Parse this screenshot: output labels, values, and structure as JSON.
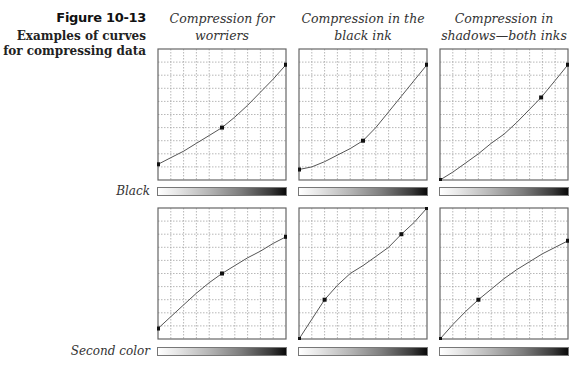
{
  "figure": {
    "number": "Figure 10-13",
    "caption": "Examples of curves for compressing data"
  },
  "columns": [
    {
      "title_line1": "Compression for",
      "title_line2": "worriers"
    },
    {
      "title_line1": "Compression in the",
      "title_line2": "black ink"
    },
    {
      "title_line1": "Compression in",
      "title_line2": "shadows—both inks"
    }
  ],
  "rows": [
    {
      "label": "Black"
    },
    {
      "label": "Second color"
    }
  ],
  "colors": {
    "grid_line": "#9a9a9a",
    "frame": "#666666",
    "curve": "#555555",
    "point": "#111111"
  },
  "chart_data": {
    "type": "line",
    "title": "Examples of curves for compressing data",
    "grid": {
      "divisions_x": 10,
      "divisions_y": 10,
      "dashed": true
    },
    "axis_range": {
      "x": [
        0,
        1
      ],
      "y": [
        0,
        1
      ]
    },
    "panels": [
      {
        "row": "Black",
        "column": "Compression for worriers",
        "points": [
          [
            0,
            0.12
          ],
          [
            0.5,
            0.4
          ],
          [
            1.0,
            0.88
          ]
        ],
        "curve": [
          [
            0,
            0.12
          ],
          [
            0.1,
            0.17
          ],
          [
            0.2,
            0.22
          ],
          [
            0.3,
            0.28
          ],
          [
            0.4,
            0.34
          ],
          [
            0.5,
            0.4
          ],
          [
            0.6,
            0.48
          ],
          [
            0.7,
            0.57
          ],
          [
            0.8,
            0.67
          ],
          [
            0.9,
            0.77
          ],
          [
            1.0,
            0.88
          ]
        ]
      },
      {
        "row": "Black",
        "column": "Compression in the black ink",
        "points": [
          [
            0,
            0.08
          ],
          [
            0.5,
            0.3
          ],
          [
            1.0,
            0.88
          ]
        ],
        "curve": [
          [
            0,
            0.08
          ],
          [
            0.1,
            0.1
          ],
          [
            0.2,
            0.14
          ],
          [
            0.3,
            0.19
          ],
          [
            0.4,
            0.24
          ],
          [
            0.5,
            0.3
          ],
          [
            0.6,
            0.4
          ],
          [
            0.7,
            0.52
          ],
          [
            0.8,
            0.64
          ],
          [
            0.9,
            0.76
          ],
          [
            1.0,
            0.88
          ]
        ]
      },
      {
        "row": "Black",
        "column": "Compression in shadows—both inks",
        "points": [
          [
            0,
            0.0
          ],
          [
            0.79,
            0.63
          ],
          [
            1.0,
            0.88
          ]
        ],
        "curve": [
          [
            0,
            0.0
          ],
          [
            0.1,
            0.06
          ],
          [
            0.2,
            0.13
          ],
          [
            0.3,
            0.2
          ],
          [
            0.4,
            0.28
          ],
          [
            0.5,
            0.35
          ],
          [
            0.6,
            0.44
          ],
          [
            0.7,
            0.54
          ],
          [
            0.79,
            0.63
          ],
          [
            0.9,
            0.76
          ],
          [
            1.0,
            0.88
          ]
        ]
      },
      {
        "row": "Second color",
        "column": "Compression for worriers",
        "points": [
          [
            0,
            0.08
          ],
          [
            0.5,
            0.5
          ],
          [
            1.0,
            0.78
          ]
        ],
        "curve": [
          [
            0,
            0.08
          ],
          [
            0.1,
            0.17
          ],
          [
            0.2,
            0.26
          ],
          [
            0.3,
            0.35
          ],
          [
            0.4,
            0.43
          ],
          [
            0.5,
            0.5
          ],
          [
            0.6,
            0.56
          ],
          [
            0.7,
            0.62
          ],
          [
            0.8,
            0.67
          ],
          [
            0.9,
            0.73
          ],
          [
            1.0,
            0.78
          ]
        ]
      },
      {
        "row": "Second color",
        "column": "Compression in the black ink",
        "points": [
          [
            0,
            0.0
          ],
          [
            0.2,
            0.3
          ],
          [
            0.8,
            0.8
          ],
          [
            1.0,
            1.0
          ]
        ],
        "curve": [
          [
            0,
            0.0
          ],
          [
            0.1,
            0.15
          ],
          [
            0.2,
            0.3
          ],
          [
            0.3,
            0.41
          ],
          [
            0.4,
            0.5
          ],
          [
            0.5,
            0.56
          ],
          [
            0.6,
            0.63
          ],
          [
            0.7,
            0.7
          ],
          [
            0.8,
            0.8
          ],
          [
            0.9,
            0.89
          ],
          [
            1.0,
            1.0
          ]
        ]
      },
      {
        "row": "Second color",
        "column": "Compression in shadows—both inks",
        "points": [
          [
            0,
            0.0
          ],
          [
            0.3,
            0.3
          ],
          [
            1.0,
            0.75
          ]
        ],
        "curve": [
          [
            0,
            0.0
          ],
          [
            0.1,
            0.11
          ],
          [
            0.2,
            0.21
          ],
          [
            0.3,
            0.3
          ],
          [
            0.4,
            0.38
          ],
          [
            0.5,
            0.46
          ],
          [
            0.6,
            0.53
          ],
          [
            0.7,
            0.59
          ],
          [
            0.8,
            0.65
          ],
          [
            0.9,
            0.7
          ],
          [
            1.0,
            0.75
          ]
        ]
      }
    ],
    "gradient_bars": "white-to-black ramp below each curve grid"
  }
}
